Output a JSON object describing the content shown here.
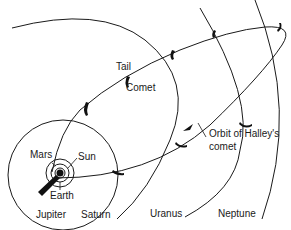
{
  "title": "Orbit of Halley's comet",
  "labels": {
    "tail": "Tail",
    "comet": "Comet",
    "mars": "Mars",
    "sun": "Sun",
    "earth": "Earth",
    "jupiter": "Jupiter",
    "saturn": "Saturn",
    "uranus": "Uranus",
    "neptune": "Neptune",
    "orbit_line1": "Orbit of Halley's",
    "orbit_line2": "comet"
  },
  "colors": {
    "ink": "#1a1a1a",
    "background": "#ffffff"
  }
}
